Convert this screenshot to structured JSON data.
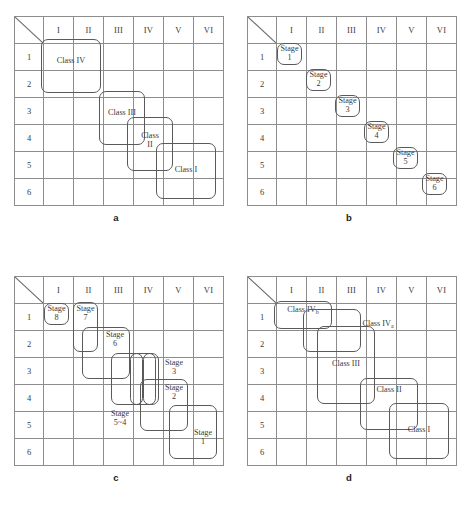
{
  "figure": {
    "columns": [
      "I",
      "II",
      "III",
      "IV",
      "V",
      "VI"
    ],
    "rows": [
      "1",
      "2",
      "3",
      "4",
      "5",
      "6"
    ]
  },
  "panels": [
    {
      "id": "a",
      "caption": "a",
      "boxes": [
        {
          "name": "class-iv-box",
          "label": "Class  IV",
          "lines": [
            "Class  IV"
          ]
        },
        {
          "name": "class-iii-box",
          "label": "Class  III",
          "lines": [
            "Class  III"
          ]
        },
        {
          "name": "class-ii-box",
          "label": "Class II",
          "lines": [
            "Class",
            "II"
          ]
        },
        {
          "name": "class-i-box",
          "label": "Class  I",
          "lines": [
            "Class   I"
          ]
        }
      ]
    },
    {
      "id": "b",
      "caption": "b",
      "boxes": [
        {
          "name": "stage-1-box",
          "label": "Stage 1",
          "lines": [
            "Stage",
            "1"
          ]
        },
        {
          "name": "stage-2-box",
          "label": "Stage 2",
          "lines": [
            "Stage",
            "2"
          ]
        },
        {
          "name": "stage-3-box",
          "label": "Stage 3",
          "lines": [
            "Stage",
            "3"
          ]
        },
        {
          "name": "stage-4-box",
          "label": "Stage 4",
          "lines": [
            "Stage",
            "4"
          ]
        },
        {
          "name": "stage-5-box",
          "label": "Stage 5",
          "lines": [
            "Stage",
            "5"
          ]
        },
        {
          "name": "stage-6-box",
          "label": "Stage 6",
          "lines": [
            "Stage",
            "6"
          ]
        }
      ]
    },
    {
      "id": "c",
      "caption": "c",
      "boxes": [
        {
          "name": "stage-8-box",
          "label": "Stage 8",
          "lines": [
            "Stage",
            "8"
          ]
        },
        {
          "name": "stage-7-box",
          "label": "Stage 7",
          "lines": [
            "Stage",
            "7"
          ]
        },
        {
          "name": "stage-6-box",
          "label": "Stage 6",
          "lines": [
            "Stage",
            "6"
          ]
        },
        {
          "name": "stage-3-box",
          "label": "Stage 3",
          "lines": [
            "Stage",
            "3"
          ]
        },
        {
          "name": "stage-2-box",
          "label": "Stage 2",
          "lines": [
            "Stage",
            "2"
          ]
        },
        {
          "name": "stage-5-4-label",
          "label": "Stage 5~4",
          "lines": [
            "Stage",
            "5~4"
          ]
        },
        {
          "name": "stage-1-box",
          "label": "Stage 1",
          "lines": [
            "Stage",
            "1"
          ]
        }
      ]
    },
    {
      "id": "d",
      "caption": "d",
      "boxes": [
        {
          "name": "class-ivb-box",
          "label": "Class  IVb",
          "lines": [
            "Class  IV"
          ],
          "sub": "b"
        },
        {
          "name": "class-iva-box",
          "label": "Class  IVa",
          "lines": [
            "Class  IV"
          ],
          "sub": "a"
        },
        {
          "name": "class-iii-box",
          "label": "Class III",
          "lines": [
            "Class III"
          ]
        },
        {
          "name": "class-ii-box",
          "label": "Class  II",
          "lines": [
            "Class  II"
          ]
        },
        {
          "name": "class-i-box",
          "label": "Class  I",
          "lines": [
            "Class  I"
          ]
        }
      ]
    }
  ]
}
